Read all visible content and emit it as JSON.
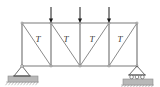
{
  "figure": {
    "type": "structural-truss-diagram",
    "width": 160,
    "height": 87,
    "background_color": "#ffffff"
  },
  "colors": {
    "member": "#6e6e6e",
    "chord": "#7a7a7a",
    "diagonal": "#8a8a8a",
    "load_arrow": "#1a1a1a",
    "support_outline": "#5a5a5a",
    "ground_fill": "#b8b8b8",
    "label_text": "#3a3a3a"
  },
  "geometry": {
    "top_chord_y": 23,
    "bottom_chord_y": 66,
    "left_x": 22,
    "right_x": 137,
    "panel_node_x": [
      22,
      51,
      80,
      109,
      137
    ],
    "panel_count": 4
  },
  "chords": [
    {
      "name": "top-chord",
      "x1": 22,
      "y1": 23,
      "x2": 137,
      "y2": 23
    },
    {
      "name": "bottom-chord",
      "x1": 22,
      "y1": 66,
      "x2": 137,
      "y2": 66
    }
  ],
  "verticals": [
    {
      "name": "vertical-0",
      "x": 22,
      "y1": 23,
      "y2": 66
    },
    {
      "name": "vertical-1",
      "x": 51,
      "y1": 23,
      "y2": 66
    },
    {
      "name": "vertical-2",
      "x": 80,
      "y1": 23,
      "y2": 66
    },
    {
      "name": "vertical-3",
      "x": 109,
      "y1": 23,
      "y2": 66
    },
    {
      "name": "vertical-4",
      "x": 137,
      "y1": 23,
      "y2": 66
    }
  ],
  "diagonals": [
    {
      "name": "diagonal-panel-1",
      "x1": 22,
      "y1": 23,
      "x2": 51,
      "y2": 66,
      "direction": "top-left-to-bottom-right"
    },
    {
      "name": "diagonal-panel-2",
      "x1": 51,
      "y1": 23,
      "x2": 80,
      "y2": 66,
      "direction": "top-left-to-bottom-right"
    },
    {
      "name": "diagonal-panel-3",
      "x1": 80,
      "y1": 66,
      "x2": 109,
      "y2": 23,
      "direction": "bottom-left-to-top-right"
    },
    {
      "name": "diagonal-panel-4",
      "x1": 109,
      "y1": 66,
      "x2": 137,
      "y2": 23,
      "direction": "bottom-left-to-top-right"
    }
  ],
  "panel_labels": [
    {
      "name": "panel-label-1",
      "text": "T",
      "x": 38,
      "y": 40
    },
    {
      "name": "panel-label-2",
      "text": "T",
      "x": 66,
      "y": 40
    },
    {
      "name": "panel-label-3",
      "text": "T",
      "x": 92,
      "y": 40
    },
    {
      "name": "panel-label-4",
      "text": "T",
      "x": 120,
      "y": 40
    }
  ],
  "loads": [
    {
      "name": "load-arrow-1",
      "x": 51,
      "tail_y": 7,
      "head_y": 23,
      "direction": "down"
    },
    {
      "name": "load-arrow-2",
      "x": 80,
      "tail_y": 7,
      "head_y": 23,
      "direction": "down"
    },
    {
      "name": "load-arrow-3",
      "x": 109,
      "tail_y": 7,
      "head_y": 23,
      "direction": "down"
    }
  ],
  "supports": [
    {
      "name": "support-pin-left",
      "kind": "pin",
      "x": 22,
      "y": 66,
      "tri_half_width": 8,
      "tri_height": 10,
      "pad_x": 8,
      "pad_y": 76,
      "pad_width": 30,
      "pad_height": 6
    },
    {
      "name": "support-roller-right",
      "kind": "roller",
      "x": 137,
      "y": 66,
      "tri_half_width": 8,
      "tri_height": 9,
      "pad_x": 123,
      "pad_y": 79,
      "pad_width": 30,
      "pad_height": 6,
      "roller_count": 3,
      "roller_radius": 1.8,
      "roller_y": 77
    }
  ],
  "joints": [
    {
      "name": "joint-top-left",
      "x": 22,
      "y": 23
    },
    {
      "name": "joint-top-1",
      "x": 51,
      "y": 23
    },
    {
      "name": "joint-top-2",
      "x": 80,
      "y": 23
    },
    {
      "name": "joint-top-3",
      "x": 109,
      "y": 23
    },
    {
      "name": "joint-top-right",
      "x": 137,
      "y": 23
    },
    {
      "name": "joint-bot-left",
      "x": 22,
      "y": 66
    },
    {
      "name": "joint-bot-1",
      "x": 51,
      "y": 66
    },
    {
      "name": "joint-bot-2",
      "x": 80,
      "y": 66
    },
    {
      "name": "joint-bot-3",
      "x": 109,
      "y": 66
    },
    {
      "name": "joint-bot-right",
      "x": 137,
      "y": 66
    }
  ]
}
